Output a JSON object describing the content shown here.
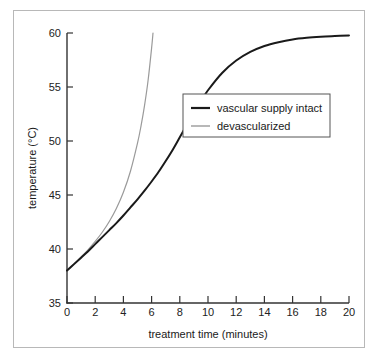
{
  "figure": {
    "background_color": "#ffffff",
    "frame_color": "#b8b8b8"
  },
  "chart_data": {
    "type": "line",
    "title": "",
    "xlabel": "treatment time (minutes)",
    "ylabel": "temperature (°C)",
    "xlim": [
      0,
      20
    ],
    "ylim": [
      35,
      60
    ],
    "xticks": [
      0,
      2,
      4,
      6,
      8,
      10,
      12,
      14,
      16,
      18,
      20
    ],
    "xtick_labels": [
      "0",
      "2",
      "4",
      "6",
      "8",
      "10",
      "12",
      "14",
      "16",
      "18",
      "20"
    ],
    "yticks": [
      35,
      40,
      45,
      50,
      55,
      60
    ],
    "ytick_labels": [
      "35",
      "40",
      "45",
      "50",
      "55",
      "60"
    ],
    "grid": false,
    "legend_position": "center-right",
    "series": [
      {
        "name": "vascular supply intact",
        "color": "#1a1a1a",
        "linewidth": 2.0,
        "x": [
          0,
          0.5,
          1,
          1.5,
          2,
          2.5,
          3,
          3.5,
          4,
          4.5,
          5,
          5.5,
          6,
          6.5,
          7,
          7.5,
          8,
          8.5,
          9,
          9.5,
          10,
          11,
          12,
          13,
          14,
          15,
          16,
          17,
          18,
          19,
          20
        ],
        "y": [
          38.0,
          38.6,
          39.2,
          39.8,
          40.45,
          41.1,
          41.75,
          42.4,
          43.1,
          43.85,
          44.6,
          45.4,
          46.25,
          47.15,
          48.15,
          49.2,
          50.35,
          51.5,
          52.65,
          53.7,
          54.7,
          56.3,
          57.45,
          58.25,
          58.8,
          59.15,
          59.4,
          59.55,
          59.65,
          59.72,
          59.78
        ]
      },
      {
        "name": "devascularized",
        "color": "#9a9a9a",
        "linewidth": 1.2,
        "x": [
          0,
          0.5,
          1,
          1.5,
          2,
          2.5,
          3,
          3.5,
          4,
          4.5,
          5,
          5.25,
          5.5,
          5.75,
          6.0,
          6.1
        ],
        "y": [
          38.0,
          38.62,
          39.26,
          39.95,
          40.7,
          41.55,
          42.55,
          43.75,
          45.25,
          47.2,
          49.8,
          51.4,
          53.3,
          55.6,
          58.6,
          60.0
        ]
      }
    ]
  },
  "legend": {
    "entries": [
      {
        "label": "vascular supply intact",
        "color": "#1a1a1a",
        "linewidth": 2.0
      },
      {
        "label": "devascularized",
        "color": "#9a9a9a",
        "linewidth": 1.3
      }
    ]
  }
}
